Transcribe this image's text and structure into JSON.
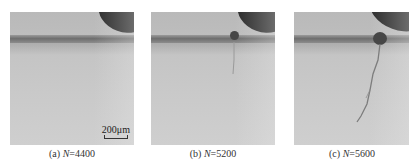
{
  "figure": {
    "panels": [
      {
        "id": "a",
        "caption_prefix": "(a) ",
        "caption_var": "N",
        "caption_value": "=4400",
        "scale_bar": "200μm",
        "feature": "no crack"
      },
      {
        "id": "b",
        "caption_prefix": "(b) ",
        "caption_var": "N",
        "caption_value": "=5200",
        "feature": "crack initiation"
      },
      {
        "id": "c",
        "caption_prefix": "(c) ",
        "caption_var": "N",
        "caption_value": "=5600",
        "feature": "crack propagation"
      }
    ]
  }
}
